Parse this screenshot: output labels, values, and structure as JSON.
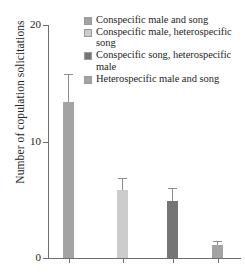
{
  "chart_data": {
    "type": "bar",
    "title": "",
    "xlabel": "",
    "ylabel": "Number of copulation solicitations",
    "ylim": [
      0,
      20
    ],
    "yticks": [
      0,
      10,
      20
    ],
    "ytick_labels": [
      "0",
      "10",
      "20"
    ],
    "grid": false,
    "legend_position": "top-right",
    "categories": [
      "Conspecific male and song",
      "Conspecific male, heterospecific song",
      "Conspecific song, heterospecific male",
      "Heterospecific male and song"
    ],
    "values": [
      13.4,
      5.8,
      4.9,
      1.1
    ],
    "errors": [
      2.4,
      1.1,
      1.1,
      0.35
    ],
    "colors": [
      "#a3a3a3",
      "#cccccc",
      "#757575",
      "#a3a3a3"
    ]
  },
  "axes": {
    "y_title": "Number of copulation solicitations",
    "y_ticks": [
      {
        "label": "20",
        "value": 20
      },
      {
        "label": "10",
        "value": 10
      },
      {
        "label": "0",
        "value": 0
      }
    ]
  },
  "legend": {
    "entries": [
      {
        "label": "Conspecific male and song",
        "color": "#a3a3a3"
      },
      {
        "label": "Conspecific male, heterospecific song",
        "color": "#cccccc"
      },
      {
        "label": "Conspecific song, heterospecific male",
        "color": "#757575"
      },
      {
        "label": "Heterospecific male and song",
        "color": "#a3a3a3"
      }
    ]
  }
}
